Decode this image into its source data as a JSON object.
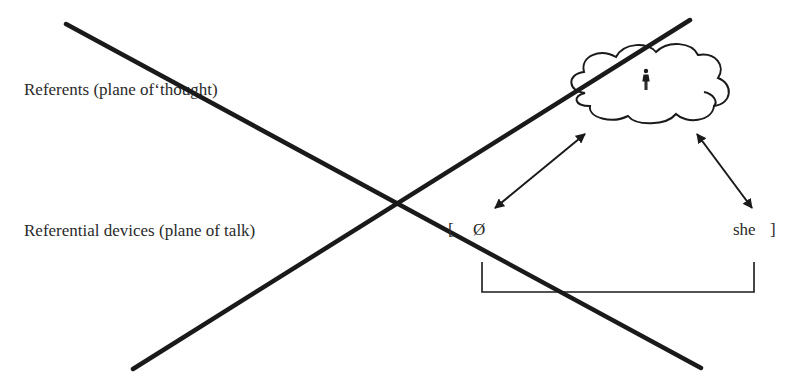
{
  "planes": {
    "thought_label": "Referents (plane of‘thought)",
    "talk_label": "Referential devices (plane of talk)"
  },
  "tokens": {
    "open_bracket": "[",
    "zero_anaphor": "Ø",
    "pronoun": "she",
    "close_bracket": "]"
  },
  "referent": {
    "container_icon": "thought-cloud-icon",
    "figure_icon": "woman-icon"
  },
  "colors": {
    "ink": "#1a1a1a",
    "text": "#2a2a2a",
    "background": "#ffffff"
  }
}
